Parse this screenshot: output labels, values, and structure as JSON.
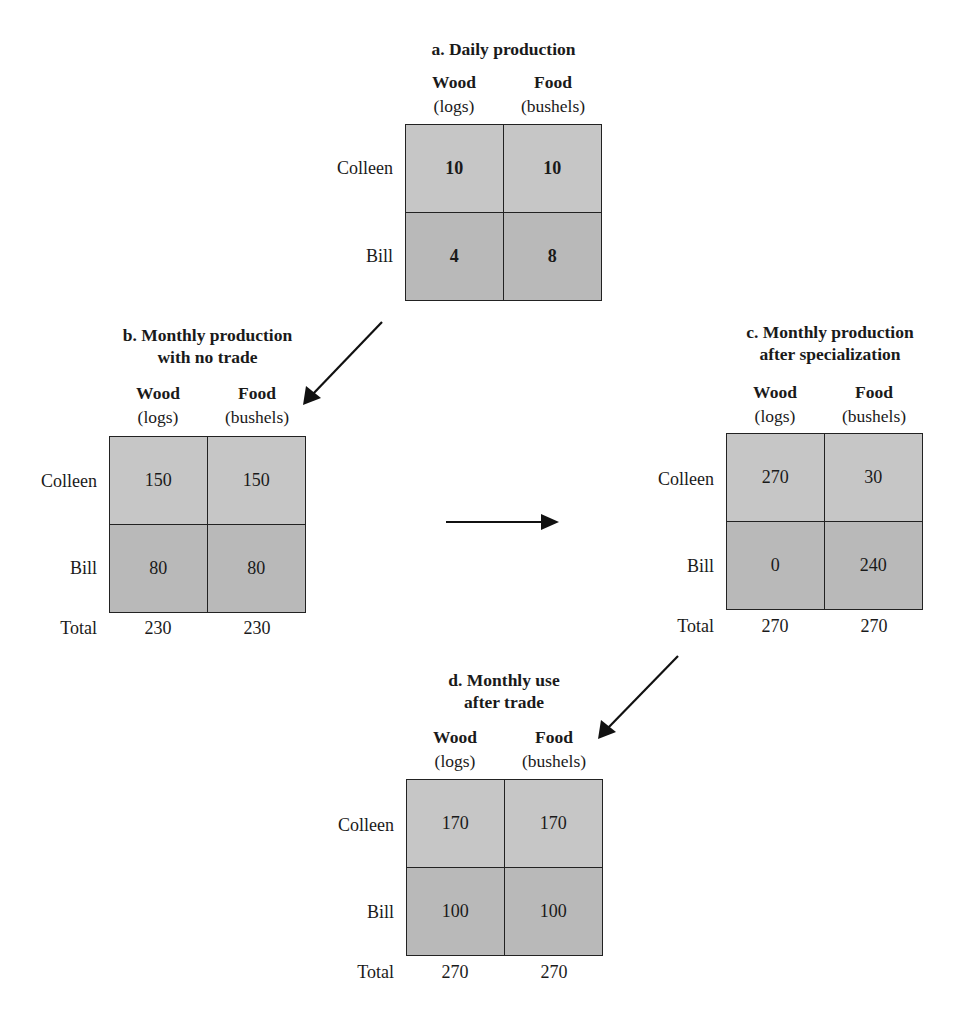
{
  "panels": {
    "a": {
      "title": "a. Daily production",
      "columns": [
        {
          "name": "Wood",
          "unit": "(logs)"
        },
        {
          "name": "Food",
          "unit": "(bushels)"
        }
      ],
      "rows": [
        {
          "label": "Colleen",
          "values": [
            "10",
            "10"
          ]
        },
        {
          "label": "Bill",
          "values": [
            "4",
            "8"
          ]
        }
      ]
    },
    "b": {
      "title": "b. Monthly production\nwith no trade",
      "columns": [
        {
          "name": "Wood",
          "unit": "(logs)"
        },
        {
          "name": "Food",
          "unit": "(bushels)"
        }
      ],
      "rows": [
        {
          "label": "Colleen",
          "values": [
            "150",
            "150"
          ]
        },
        {
          "label": "Bill",
          "values": [
            "80",
            "80"
          ]
        }
      ],
      "total": {
        "label": "Total",
        "values": [
          "230",
          "230"
        ]
      }
    },
    "c": {
      "title": "c. Monthly production\nafter specialization",
      "columns": [
        {
          "name": "Wood",
          "unit": "(logs)"
        },
        {
          "name": "Food",
          "unit": "(bushels)"
        }
      ],
      "rows": [
        {
          "label": "Colleen",
          "values": [
            "270",
            "30"
          ]
        },
        {
          "label": "Bill",
          "values": [
            "0",
            "240"
          ]
        }
      ],
      "total": {
        "label": "Total",
        "values": [
          "270",
          "270"
        ]
      }
    },
    "d": {
      "title": "d. Monthly use\nafter trade",
      "columns": [
        {
          "name": "Wood",
          "unit": "(logs)"
        },
        {
          "name": "Food",
          "unit": "(bushels)"
        }
      ],
      "rows": [
        {
          "label": "Colleen",
          "values": [
            "170",
            "170"
          ]
        },
        {
          "label": "Bill",
          "values": [
            "100",
            "100"
          ]
        }
      ],
      "total": {
        "label": "Total",
        "values": [
          "270",
          "270"
        ]
      }
    }
  },
  "arrows": [
    {
      "from": "a",
      "to": "b",
      "direction": "down-left"
    },
    {
      "from": "b",
      "to": "c",
      "direction": "right"
    },
    {
      "from": "c",
      "to": "d",
      "direction": "down-left"
    }
  ],
  "colors": {
    "cell_top": "#c6c6c6",
    "cell_bottom": "#b9b9b9",
    "border": "#222222",
    "text": "#1a1a1a"
  }
}
